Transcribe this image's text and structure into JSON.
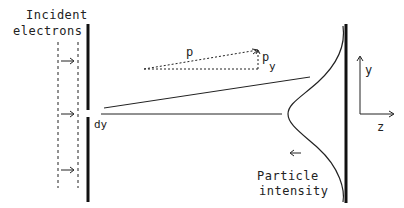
{
  "diagram": {
    "incident_label": [
      "Incident",
      "electrons"
    ],
    "slit_width_label": "dy",
    "momentum_label": "p",
    "momentum_y_label": "p",
    "momentum_y_subscript": "y",
    "axis_y_label": "y",
    "axis_z_label": "z",
    "intensity_label": [
      "Particle",
      "intensity"
    ],
    "arrow_glyph": "→",
    "left_arrow_glyph": "←",
    "colors": {
      "ink": "#222222",
      "background": "#ffffff"
    }
  }
}
